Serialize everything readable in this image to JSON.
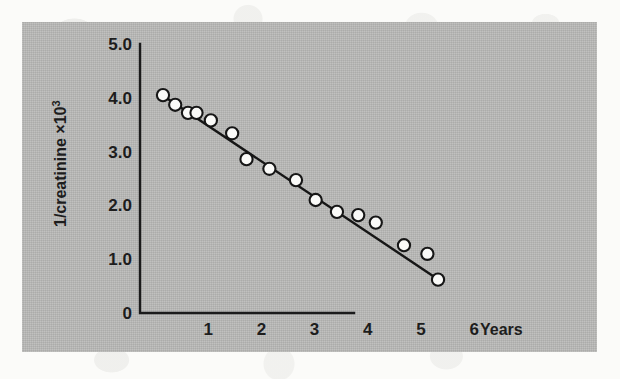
{
  "figure": {
    "panel_background": "#b9b9b7",
    "page_background": "#fbfbf9",
    "ink_color": "#161616",
    "marker_fill": "#fafaf8"
  },
  "axes": {
    "y_title_main": "1/creatinine ×10",
    "y_title_exponent": "3",
    "x_title": "Years",
    "y_ticks": [
      "0",
      "1.0",
      "2.0",
      "3.0",
      "4.0",
      "5.0"
    ],
    "x_ticks": [
      "1",
      "2",
      "3",
      "4",
      "5",
      "6"
    ]
  },
  "chart_data": {
    "type": "scatter",
    "title": "",
    "xlabel": "Years",
    "ylabel": "1/creatinine ×10³",
    "xlim": [
      0,
      6.3
    ],
    "ylim": [
      0,
      5.0
    ],
    "grid": false,
    "legend": "none",
    "x_tick_values": [
      1,
      2,
      3,
      4,
      5,
      6
    ],
    "y_tick_values": [
      0,
      1.0,
      2.0,
      3.0,
      4.0,
      5.0
    ],
    "series": [
      {
        "name": "1/creatinine measurements",
        "marker": "open-circle",
        "x": [
          0.15,
          0.38,
          0.62,
          0.78,
          1.05,
          1.45,
          1.72,
          2.15,
          2.65,
          3.02,
          3.42,
          3.82,
          4.15,
          4.68,
          5.12,
          5.32
        ],
        "y": [
          4.05,
          3.87,
          3.72,
          3.72,
          3.58,
          3.34,
          2.86,
          2.68,
          2.47,
          2.1,
          1.88,
          1.82,
          1.68,
          1.26,
          1.1,
          0.62
        ]
      }
    ],
    "fit_line": {
      "name": "linear regression",
      "x_start": 0.18,
      "y_start": 4.02,
      "x_end": 5.33,
      "y_end": 0.62
    }
  }
}
